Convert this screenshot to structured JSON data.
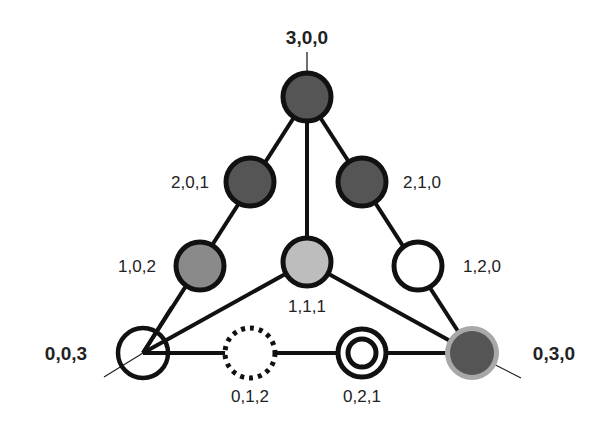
{
  "diagram": {
    "type": "ternary-simplex-lattice",
    "colors": {
      "edge": "#111111",
      "dark_fill": "#555555",
      "medium_fill": "#8a8a8a",
      "light_fill": "#bdbdbd",
      "white_fill": "#ffffff",
      "halo": "#a8a8a8"
    },
    "vertices": {
      "top": {
        "label": "3,0,0"
      },
      "left": {
        "label": "0,0,3"
      },
      "right": {
        "label": "0,3,0"
      }
    },
    "nodes": [
      {
        "id": "n300",
        "label": "3,0,0",
        "style": "dark"
      },
      {
        "id": "n201",
        "label": "2,0,1",
        "style": "dark"
      },
      {
        "id": "n210",
        "label": "2,1,0",
        "style": "dark"
      },
      {
        "id": "n102",
        "label": "1,0,2",
        "style": "medium"
      },
      {
        "id": "n111",
        "label": "1,1,1",
        "style": "light"
      },
      {
        "id": "n120",
        "label": "1,2,0",
        "style": "white"
      },
      {
        "id": "n003",
        "label": "0,0,3",
        "style": "white"
      },
      {
        "id": "n012",
        "label": "0,1,2",
        "style": "dashed-white"
      },
      {
        "id": "n021",
        "label": "0,2,1",
        "style": "double-ring"
      },
      {
        "id": "n030",
        "label": "0,3,0",
        "style": "dark-with-halo"
      }
    ]
  }
}
